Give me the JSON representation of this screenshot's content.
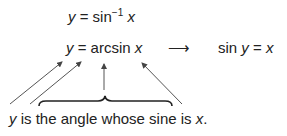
{
  "equations": {
    "line1": {
      "lhs": "y",
      "eq": "=",
      "func": "sin",
      "sup": "−1",
      "arg": "x"
    },
    "line2": {
      "lhs": "y",
      "eq": "=",
      "func": "arcsin",
      "arg": "x"
    },
    "arrow": "⟶",
    "line3": {
      "func": "sin",
      "var": "y",
      "eq": "=",
      "rhs": "x"
    }
  },
  "caption": {
    "var": "y",
    "text": " is the angle whose sine is ",
    "var2": "x",
    "end": "."
  },
  "colors": {
    "text": "#222222",
    "arrow": "#555555"
  }
}
